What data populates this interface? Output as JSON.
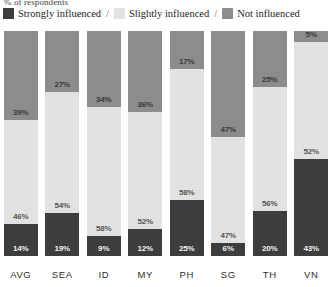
{
  "subtitle": "% of respondents",
  "legend": {
    "separator": "/",
    "items": [
      {
        "label": "Strongly influenced",
        "key": "strongly",
        "color": "#3d3d3d"
      },
      {
        "label": "Slightly influenced",
        "key": "slightly",
        "color": "#e2e2e2"
      },
      {
        "label": "Not influenced",
        "key": "not",
        "color": "#8c8c8c"
      }
    ]
  },
  "chart_data": {
    "type": "bar",
    "title": "",
    "subtitle": "% of respondents",
    "xlabel": "",
    "ylabel": "% of respondents",
    "ylim": [
      0,
      100
    ],
    "grid": false,
    "stacked": true,
    "normalized_100": true,
    "legend_position": "top",
    "categories": [
      "AVG",
      "SEA",
      "ID",
      "MY",
      "PH",
      "SG",
      "TH",
      "VN"
    ],
    "series": [
      {
        "name": "Strongly influenced",
        "color": "#3d3d3d",
        "values": [
          14,
          19,
          9,
          12,
          25,
          6,
          20,
          43
        ]
      },
      {
        "name": "Slightly influenced",
        "color": "#e2e2e2",
        "values": [
          46,
          54,
          58,
          52,
          58,
          47,
          56,
          52
        ]
      },
      {
        "name": "Not influenced",
        "color": "#8c8c8c",
        "values": [
          39,
          27,
          34,
          36,
          17,
          47,
          25,
          5
        ]
      }
    ],
    "labels": {
      "strongly": [
        "14%",
        "19%",
        "9%",
        "12%",
        "25%",
        "6%",
        "20%",
        "43%"
      ],
      "slightly": [
        "46%",
        "54%",
        "58%",
        "52%",
        "58%",
        "47%",
        "56%",
        "52%"
      ],
      "not": [
        "39%",
        "27%",
        "34%",
        "36%",
        "17%",
        "47%",
        "25%",
        "5%"
      ]
    }
  }
}
